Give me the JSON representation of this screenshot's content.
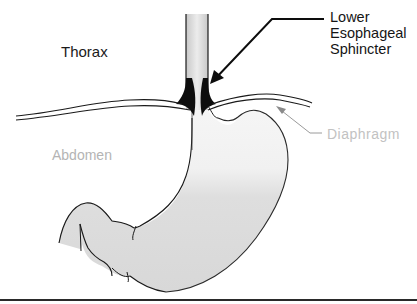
{
  "diagram": {
    "type": "anatomical-illustration",
    "labels": {
      "thorax": "Thorax",
      "abdomen": "Abdomen",
      "les_line1": "Lower",
      "les_line2": "Esophageal",
      "les_line3": "Sphincter",
      "diaphragm": "Diaphragm"
    },
    "colors": {
      "background": "#ffffff",
      "outline": "#1a1a1a",
      "stomach_fill": "#dcdcdc",
      "esophagus_fill": "#e2e2e2",
      "sphincter": "#0d0d0d",
      "diaphragm_label": "#c2c2c2",
      "abdomen_label": "#b4b4b4"
    }
  }
}
